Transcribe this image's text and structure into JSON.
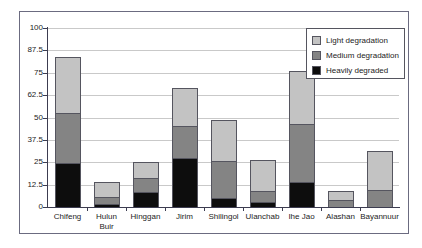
{
  "chart_data": {
    "type": "bar",
    "stacked": true,
    "title": "",
    "subtitle": "",
    "xlabel": "",
    "ylabel": "",
    "ylim": [
      0,
      100
    ],
    "yticks": [
      "0",
      "12.5",
      "25",
      "37.5",
      "50",
      "62.5",
      "75",
      "87.5",
      "100"
    ],
    "ytick_values": [
      0,
      12.5,
      25,
      37.5,
      50,
      62.5,
      75,
      87.5,
      100
    ],
    "grid": "horizontal",
    "legend_position": "top-right",
    "categories": [
      "Chifeng",
      "Hulun Buir",
      "Hinggan",
      "Jirim",
      "Shilingol",
      "Ulanchab",
      "Ihe Jao",
      "Alashan",
      "Bayannuur"
    ],
    "category_lines": [
      [
        "Chifeng"
      ],
      [
        "Hulun",
        "Buir"
      ],
      [
        "Hinggan"
      ],
      [
        "Jirim"
      ],
      [
        "Shilingol"
      ],
      [
        "Ulanchab"
      ],
      [
        "Ihe Jao"
      ],
      [
        "Alashan"
      ],
      [
        "Bayannuur"
      ]
    ],
    "series": [
      {
        "name": "Heavily degraded",
        "color": "#0d0d0d",
        "values": [
          24.5,
          1.5,
          8.5,
          27.5,
          5,
          3,
          14,
          0,
          0
        ]
      },
      {
        "name": "Medium degradation",
        "color": "#848484",
        "values": [
          28,
          4,
          7.5,
          17.5,
          20.5,
          6,
          32.5,
          4,
          9.5
        ]
      },
      {
        "name": "Light degradation",
        "color": "#c3c3c3",
        "values": [
          31.5,
          8.5,
          9,
          21.5,
          23,
          17.5,
          29.5,
          5,
          22
        ]
      }
    ],
    "totals": [
      84,
      14,
      25,
      66.5,
      48.5,
      26.5,
      76,
      9,
      31.5
    ]
  },
  "legend": {
    "entries": [
      {
        "label": "Light degradation",
        "color": "#c3c3c3"
      },
      {
        "label": "Medium degradation",
        "color": "#848484"
      },
      {
        "label": "Heavily degraded",
        "color": "#0d0d0d"
      }
    ]
  }
}
